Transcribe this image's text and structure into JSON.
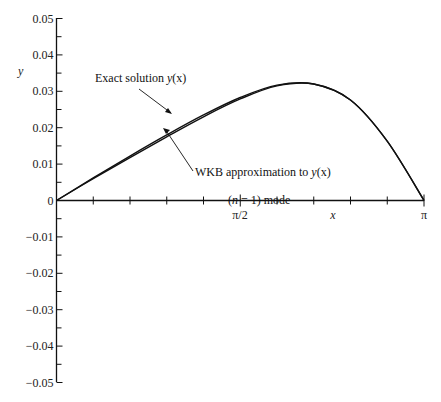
{
  "chart_data": {
    "type": "line",
    "title": "",
    "xlabel": "x",
    "ylabel": "y",
    "xlim": [
      0,
      3.14159
    ],
    "ylim": [
      -0.05,
      0.05
    ],
    "grid": false,
    "legend": "none (curves labeled by arrow annotations)",
    "x_ticks": {
      "count": 11,
      "labels": [
        {
          "value": 1.5708,
          "label": "π/2"
        },
        {
          "value": 3.14159,
          "label": "π"
        }
      ]
    },
    "y_ticks": {
      "labels": [
        "0.05",
        "0.04",
        "0.03",
        "0.02",
        "0.01",
        "0",
        "−0.01",
        "−0.02",
        "−0.03",
        "−0.04",
        "−0.05"
      ],
      "values": [
        0.05,
        0.04,
        0.03,
        0.02,
        0.01,
        0,
        -0.01,
        -0.02,
        -0.03,
        -0.04,
        -0.05
      ],
      "minor_per_major": 1
    },
    "series": [
      {
        "name": "Exact solution y(x)",
        "x": [
          0,
          0.314,
          0.628,
          0.942,
          1.257,
          1.571,
          1.885,
          2.199,
          2.513,
          2.827,
          3.142
        ],
        "y": [
          0,
          0.0062,
          0.0122,
          0.018,
          0.0235,
          0.0283,
          0.0317,
          0.032,
          0.0276,
          0.0163,
          0
        ]
      },
      {
        "name": "WKB approximation to y(x)",
        "x": [
          0,
          0.314,
          0.628,
          0.942,
          1.257,
          1.571,
          1.885,
          2.199,
          2.513,
          2.827,
          3.142
        ],
        "y": [
          0,
          0.006,
          0.0118,
          0.0175,
          0.023,
          0.0279,
          0.0315,
          0.032,
          0.0276,
          0.0163,
          0
        ]
      }
    ],
    "annotations": [
      {
        "text": "Exact solution y(x)",
        "points_to": "upper curve near x≈1.1"
      },
      {
        "text": "WKB approximation to y(x)",
        "points_to": "lower curve near x≈0.95"
      },
      {
        "text": "(n = 1) mode"
      }
    ]
  },
  "labels": {
    "y_axis": "y",
    "x_axis": "x",
    "x_tick_half_pi": "π/2",
    "x_tick_pi": "π",
    "y_ticks": [
      "0.05",
      "0.04",
      "0.03",
      "0.02",
      "0.01",
      "0",
      "−0.01",
      "−0.02",
      "−0.03",
      "−0.04",
      "−0.05"
    ],
    "exact_label_pre": "Exact solution ",
    "exact_label_fn": "y",
    "exact_label_arg": "(x)",
    "wkb_label_pre": "WKB approximation to ",
    "wkb_label_fn": "y",
    "wkb_label_arg": "(x)",
    "mode_open": "(",
    "mode_n": "n",
    "mode_rest": " = 1) mode"
  }
}
